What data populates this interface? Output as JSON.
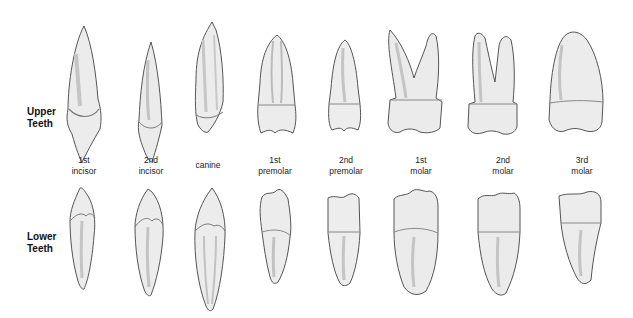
{
  "rows": {
    "upper": {
      "line1": "Upper",
      "line2": "Teeth"
    },
    "lower": {
      "line1": "Lower",
      "line2": "Teeth"
    }
  },
  "columns": [
    {
      "line1": "1st",
      "line2": "incisor"
    },
    {
      "line1": "2nd",
      "line2": "incisor"
    },
    {
      "line1": "canine",
      "line2": ""
    },
    {
      "line1": "1st",
      "line2": "premolar"
    },
    {
      "line1": "2nd",
      "line2": "premolar"
    },
    {
      "line1": "1st",
      "line2": "molar"
    },
    {
      "line1": "2nd",
      "line2": "molar"
    },
    {
      "line1": "3rd",
      "line2": "molar"
    }
  ],
  "colors": {
    "tooth_fill": "#e9e9e9",
    "tooth_stroke": "#555555",
    "tooth_shade": "#b8b8b8"
  }
}
